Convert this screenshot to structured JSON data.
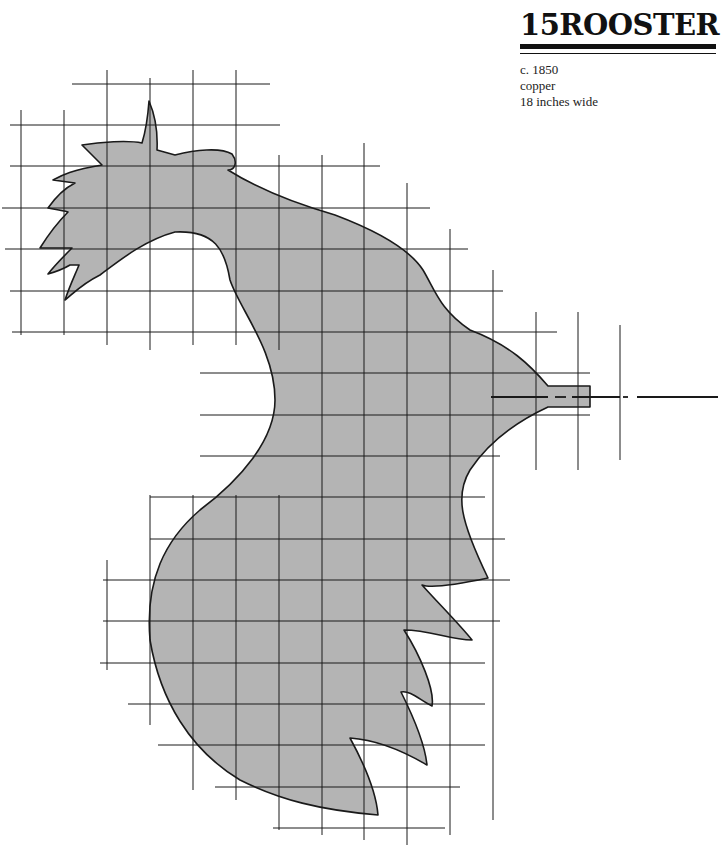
{
  "header": {
    "number": "15",
    "title": "ROOSTER"
  },
  "details": {
    "date": "c. 1850",
    "material": "copper",
    "size": "18 inches wide"
  },
  "colors": {
    "fill": "#b4b4b4",
    "line": "#1a1a1a",
    "background": "#ffffff"
  },
  "grid": {
    "horizontal": [
      {
        "y": 84,
        "x1": 72,
        "x2": 270
      },
      {
        "y": 125,
        "x1": 10,
        "x2": 280
      },
      {
        "y": 166,
        "x1": 10,
        "x2": 380
      },
      {
        "y": 208,
        "x1": 2,
        "x2": 430
      },
      {
        "y": 249,
        "x1": 5,
        "x2": 468
      },
      {
        "y": 291,
        "x1": 10,
        "x2": 503
      },
      {
        "y": 332,
        "x1": 12,
        "x2": 557
      },
      {
        "y": 373,
        "x1": 200,
        "x2": 590
      },
      {
        "y": 415,
        "x1": 200,
        "x2": 590
      },
      {
        "y": 456,
        "x1": 200,
        "x2": 500
      },
      {
        "y": 497,
        "x1": 150,
        "x2": 485
      },
      {
        "y": 539,
        "x1": 150,
        "x2": 505
      },
      {
        "y": 580,
        "x1": 103,
        "x2": 510
      },
      {
        "y": 621,
        "x1": 103,
        "x2": 500
      },
      {
        "y": 663,
        "x1": 100,
        "x2": 485
      },
      {
        "y": 704,
        "x1": 128,
        "x2": 485
      },
      {
        "y": 745,
        "x1": 158,
        "x2": 485
      },
      {
        "y": 787,
        "x1": 215,
        "x2": 460
      },
      {
        "y": 828,
        "x1": 273,
        "x2": 445
      }
    ],
    "vertical": [
      {
        "x": 21,
        "y1": 110,
        "y2": 335
      },
      {
        "x": 64,
        "y1": 110,
        "y2": 335
      },
      {
        "x": 107,
        "y1": 70,
        "y2": 345
      },
      {
        "x": 150,
        "y1": 78,
        "y2": 350
      },
      {
        "x": 193,
        "y1": 70,
        "y2": 345
      },
      {
        "x": 236,
        "y1": 70,
        "y2": 345
      },
      {
        "x": 279,
        "y1": 155,
        "y2": 350
      },
      {
        "x": 322,
        "y1": 155,
        "y2": 835
      },
      {
        "x": 364,
        "y1": 143,
        "y2": 840
      },
      {
        "x": 407,
        "y1": 183,
        "y2": 845
      },
      {
        "x": 450,
        "y1": 229,
        "y2": 835
      },
      {
        "x": 493,
        "y1": 270,
        "y2": 820
      },
      {
        "x": 536,
        "y1": 312,
        "y2": 470
      },
      {
        "x": 578,
        "y1": 312,
        "y2": 470
      },
      {
        "x": 620,
        "y1": 325,
        "y2": 460
      },
      {
        "x": 150,
        "y1": 495,
        "y2": 725
      },
      {
        "x": 107,
        "y1": 560,
        "y2": 670
      },
      {
        "x": 193,
        "y1": 495,
        "y2": 790
      },
      {
        "x": 236,
        "y1": 495,
        "y2": 800
      },
      {
        "x": 279,
        "y1": 495,
        "y2": 830
      }
    ]
  },
  "axis_line": {
    "y": 397,
    "segments": [
      {
        "x1": 491,
        "x2": 548
      },
      {
        "x1": 555,
        "x2": 566
      },
      {
        "x1": 572,
        "x2": 620
      },
      {
        "x1": 623,
        "x2": 628
      },
      {
        "x1": 637,
        "x2": 718
      }
    ]
  },
  "silhouette_path": "M 149 101 C 155 115 158 130 157 150 L 175 155 C 195 150 220 147 232 154 C 238 162 235 170 228 170 C 260 190 300 205 335 215 C 380 232 410 250 423 270 C 435 290 440 310 470 330 C 510 345 530 365 548 386 L 590 386 L 590 407 L 548 407 C 520 420 490 440 470 470 C 455 495 460 520 488 578 C 455 585 430 588 422 585 C 440 605 460 625 472 640 C 450 640 430 630 404 630 C 420 655 435 690 432 706 C 420 700 410 690 401 692 C 415 720 425 745 427 765 C 410 755 380 740 350 738 C 362 760 376 790 378 815 C 320 810 280 800 240 780 C 190 750 160 700 150 640 C 145 580 165 540 200 510 C 240 480 275 440 275 400 C 275 350 240 310 230 280 C 225 250 215 230 175 232 C 145 240 120 260 100 275 C 80 285 72 295 65 300 C 70 285 75 275 79 265 L 70 265 C 65 268 55 272 48 274 C 55 265 65 255 72 248 L 40 248 C 50 232 58 222 68 212 C 60 210 52 209 48 208 C 55 198 65 188 75 183 L 53 180 C 62 175 72 170 102 165 L 82 145 C 100 142 128 140 142 143 C 146 130 148 115 149 101 Z"
}
